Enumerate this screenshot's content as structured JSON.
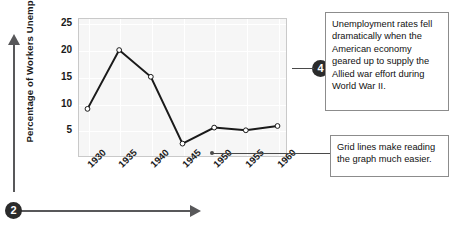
{
  "chart_data": {
    "type": "line",
    "title": "",
    "xlabel": "",
    "ylabel": "Percentage of Workers Unemployed",
    "categories": [
      "1930",
      "1935",
      "1940",
      "1945",
      "1950",
      "1955",
      "1960"
    ],
    "x": [
      1930,
      1935,
      1940,
      1945,
      1950,
      1955,
      1960
    ],
    "values": [
      9,
      20,
      15,
      2.5,
      5.5,
      5,
      5.8
    ],
    "series": [
      {
        "name": "Percentage of Workers Unemployed",
        "values": [
          9,
          20,
          15,
          2.5,
          5.5,
          5,
          5.8
        ]
      }
    ],
    "yticks": [
      5,
      10,
      15,
      20,
      25
    ],
    "ytick_labels": [
      "5",
      "10",
      "15",
      "20",
      "25"
    ],
    "xtick_labels": [
      "1930",
      "1935",
      "1940",
      "1945",
      "1950",
      "1955",
      "1960"
    ],
    "ylim": [
      0,
      26
    ],
    "xlim": [
      1928.5,
      1961.5
    ],
    "grid": true,
    "legend": false,
    "legend_position": "none",
    "marker": "open-circle",
    "line_color": "#1a1a1a",
    "plot_background": "#f6f6f6",
    "gridline_color": "#ffffff"
  },
  "annotations": {
    "callout_four": {
      "number": "4",
      "text": "Unemployment rates fell dramatically when the American economy geared up to supply the Allied war effort during World War II."
    },
    "callout_grid": {
      "text": "Grid lines make reading the graph much easier."
    },
    "callout_two": {
      "number": "2"
    }
  }
}
